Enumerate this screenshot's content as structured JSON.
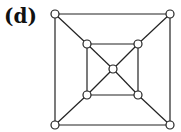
{
  "label": "(d)",
  "diagram": {
    "nodes": [
      {
        "id": "outer-tl",
        "x": 55,
        "y": 14
      },
      {
        "id": "outer-tr",
        "x": 170,
        "y": 14
      },
      {
        "id": "outer-bl",
        "x": 55,
        "y": 125
      },
      {
        "id": "outer-br",
        "x": 170,
        "y": 125
      },
      {
        "id": "inner-tl",
        "x": 87,
        "y": 44
      },
      {
        "id": "inner-tr",
        "x": 138,
        "y": 44
      },
      {
        "id": "inner-bl",
        "x": 87,
        "y": 95
      },
      {
        "id": "inner-br",
        "x": 138,
        "y": 95
      },
      {
        "id": "center",
        "x": 113,
        "y": 69
      }
    ],
    "edges": [
      [
        "outer-tl",
        "outer-tr"
      ],
      [
        "outer-tr",
        "outer-br"
      ],
      [
        "outer-br",
        "outer-bl"
      ],
      [
        "outer-bl",
        "outer-tl"
      ],
      [
        "inner-tl",
        "inner-tr"
      ],
      [
        "inner-tr",
        "inner-br"
      ],
      [
        "inner-br",
        "inner-bl"
      ],
      [
        "inner-bl",
        "inner-tl"
      ],
      [
        "outer-tl",
        "inner-tl"
      ],
      [
        "outer-tr",
        "inner-tr"
      ],
      [
        "outer-bl",
        "inner-bl"
      ],
      [
        "outer-br",
        "inner-br"
      ],
      [
        "inner-tl",
        "center"
      ],
      [
        "inner-tr",
        "center"
      ],
      [
        "inner-bl",
        "center"
      ],
      [
        "inner-br",
        "center"
      ]
    ]
  }
}
